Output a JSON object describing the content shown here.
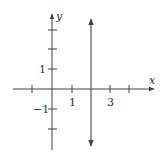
{
  "figure": {
    "type": "coordinate-plane",
    "x_axis_label": "x",
    "y_axis_label": "y",
    "x_tick_labels": [
      {
        "value": 1,
        "text": "1"
      },
      {
        "value": 3,
        "text": "3"
      }
    ],
    "y_tick_labels": [
      {
        "value": 1,
        "text": "1"
      },
      {
        "value": -1,
        "text": "−1"
      }
    ],
    "x_ticks": [
      -1,
      1,
      2,
      3,
      4
    ],
    "y_ticks": [
      -2,
      -1,
      1,
      2,
      3
    ],
    "line": {
      "equation": "x = 2",
      "description": "vertical line with arrows at both ends"
    },
    "colors": {
      "axis": "#444444",
      "line": "#555555",
      "text": "#333333"
    }
  }
}
